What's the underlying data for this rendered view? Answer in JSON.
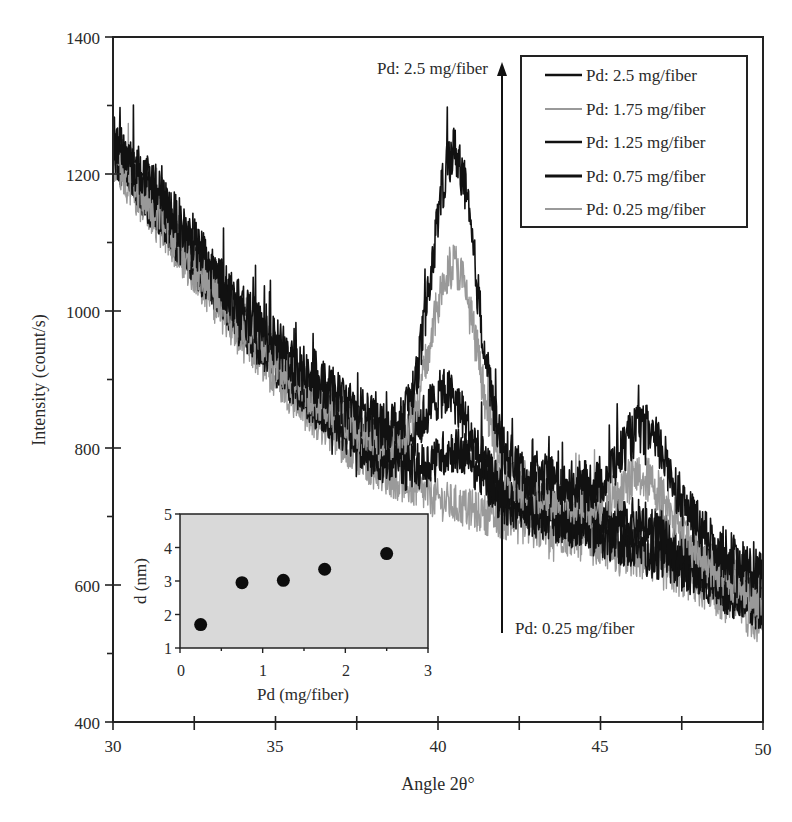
{
  "chart_data": [
    {
      "type": "line",
      "title": "",
      "xlabel": "Angle 2θ°",
      "ylabel": "Intensity (count/s)",
      "xlim": [
        30,
        50
      ],
      "ylim": [
        400,
        1400
      ],
      "x_ticks": [
        30,
        35,
        40,
        45,
        50
      ],
      "x_tick_labels": [
        "30",
        "35",
        "40",
        "45",
        "50"
      ],
      "y_ticks": [
        400,
        600,
        800,
        1000,
        1200,
        1400
      ],
      "y_tick_labels": [
        "400",
        "600",
        "800",
        "1000",
        "1200",
        "1400"
      ],
      "grid": false,
      "legend_position": "upper right",
      "series": [
        {
          "name": "Pd: 2.5 mg/fiber",
          "color": "#111111",
          "baseline": [
            [
              30,
              1255
            ],
            [
              32,
              1130
            ],
            [
              34,
              1000
            ],
            [
              36,
              905
            ],
            [
              38,
              840
            ],
            [
              40,
              800
            ],
            [
              42,
              770
            ],
            [
              44,
              745
            ],
            [
              46,
              715
            ],
            [
              48,
              670
            ],
            [
              50,
              610
            ]
          ],
          "peaks": [
            {
              "center": 40.5,
              "height": 440,
              "width": 0.95
            },
            {
              "center": 46.4,
              "height": 120,
              "width": 1.1
            }
          ],
          "noise": 38
        },
        {
          "name": "Pd: 1.75 mg/fiber",
          "color": "#999999",
          "baseline": [
            [
              30,
              1225
            ],
            [
              32,
              1100
            ],
            [
              34,
              975
            ],
            [
              36,
              880
            ],
            [
              38,
              815
            ],
            [
              40,
              775
            ],
            [
              42,
              745
            ],
            [
              44,
              720
            ],
            [
              46,
              690
            ],
            [
              48,
              640
            ],
            [
              50,
              580
            ]
          ],
          "peaks": [
            {
              "center": 40.5,
              "height": 300,
              "width": 1.0
            },
            {
              "center": 46.4,
              "height": 75,
              "width": 1.1
            }
          ],
          "noise": 34
        },
        {
          "name": "Pd: 1.25 mg/fiber",
          "color": "#111111",
          "baseline": [
            [
              30,
              1240
            ],
            [
              32,
              1110
            ],
            [
              34,
              985
            ],
            [
              36,
              885
            ],
            [
              38,
              810
            ],
            [
              40,
              765
            ],
            [
              42,
              730
            ],
            [
              44,
              700
            ],
            [
              46,
              665
            ],
            [
              48,
              625
            ],
            [
              50,
              570
            ]
          ],
          "peaks": [
            {
              "center": 40.3,
              "height": 120,
              "width": 1.0
            },
            {
              "center": 46.4,
              "height": 30,
              "width": 1.1
            }
          ],
          "noise": 36
        },
        {
          "name": "Pd: 0.75 mg/fiber",
          "color": "#111111",
          "baseline": [
            [
              30,
              1230
            ],
            [
              32,
              1100
            ],
            [
              34,
              975
            ],
            [
              36,
              870
            ],
            [
              38,
              790
            ],
            [
              40,
              745
            ],
            [
              42,
              715
            ],
            [
              44,
              690
            ],
            [
              46,
              655
            ],
            [
              48,
              615
            ],
            [
              50,
              560
            ]
          ],
          "peaks": [
            {
              "center": 40.6,
              "height": 60,
              "width": 1.0
            }
          ],
          "noise": 34
        },
        {
          "name": "Pd: 0.25 mg/fiber",
          "color": "#9a9a9a",
          "baseline": [
            [
              30,
              1215
            ],
            [
              32,
              1085
            ],
            [
              34,
              955
            ],
            [
              36,
              850
            ],
            [
              38,
              770
            ],
            [
              40,
              725
            ],
            [
              42,
              695
            ],
            [
              44,
              670
            ],
            [
              46,
              640
            ],
            [
              48,
              600
            ],
            [
              50,
              540
            ]
          ],
          "peaks": [],
          "noise": 30
        }
      ],
      "annotations": [
        {
          "text": "Pd: 2.5 mg/fiber",
          "x": 39.0,
          "y": 1355
        },
        {
          "text": "Pd: 0.25 mg/fiber",
          "x": 42.5,
          "y": 580
        },
        {
          "type": "arrow",
          "x": 42.0,
          "from_y": 545,
          "to_y": 1380,
          "direction": "up"
        }
      ]
    },
    {
      "type": "scatter",
      "title": "",
      "inset": true,
      "xlabel": "Pd (mg/fiber)",
      "ylabel": "d (nm)",
      "xlim": [
        0,
        3
      ],
      "ylim": [
        1,
        5
      ],
      "x_ticks": [
        0,
        1,
        2,
        3
      ],
      "y_ticks": [
        1,
        2,
        3,
        4,
        5
      ],
      "background": "#d8d8d8",
      "series": [
        {
          "name": "d",
          "x": [
            0.25,
            0.75,
            1.25,
            1.75,
            2.5
          ],
          "y": [
            1.7,
            2.95,
            3.02,
            3.35,
            3.82
          ]
        }
      ]
    }
  ],
  "main": {
    "xlabel": "Angle 2θ°",
    "ylabel": "Intensity (count/s)",
    "x_tick_labels": [
      "30",
      "35",
      "40",
      "45",
      "50"
    ],
    "y_tick_labels": [
      "400",
      "600",
      "800",
      "1000",
      "1200",
      "1400"
    ]
  },
  "legend": {
    "items": [
      {
        "label": "Pd: 2.5 mg/fiber",
        "color": "#111111"
      },
      {
        "label": "Pd: 1.75 mg/fiber",
        "color": "#999999"
      },
      {
        "label": "Pd: 1.25 mg/fiber",
        "color": "#111111"
      },
      {
        "label": "Pd: 0.75 mg/fiber",
        "color": "#111111"
      },
      {
        "label": "Pd: 0.25 mg/fiber",
        "color": "#9a9a9a"
      }
    ]
  },
  "annotations": {
    "top_label": "Pd: 2.5 mg/fiber",
    "bottom_label": "Pd: 0.25 mg/fiber"
  },
  "inset": {
    "xlabel": "Pd (mg/fiber)",
    "ylabel": "d (nm)",
    "x_tick_labels": [
      "0",
      "1",
      "2",
      "3"
    ],
    "y_tick_labels": [
      "1",
      "2",
      "3",
      "4",
      "5"
    ]
  }
}
